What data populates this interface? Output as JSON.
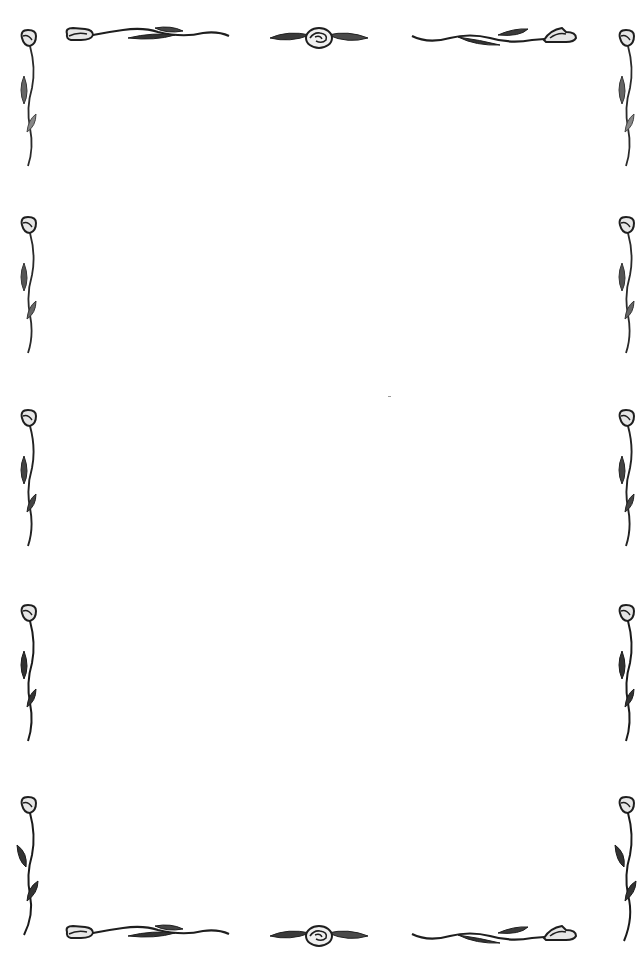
{
  "page": {
    "type": "decorative stationery border",
    "background_color": "#ffffff",
    "ink_color": "#1e1e1e",
    "leaf_shade_color": "#555555",
    "petal_fill_color": "#e6e6e6"
  },
  "border": {
    "motif": "rose bud on stem with leaves",
    "top_row": [
      {
        "name": "top-left-vine",
        "icon": "rose-bud-vine-icon",
        "x": 63,
        "y": 22,
        "w": 168,
        "h": 26,
        "flip": false
      },
      {
        "name": "top-center-rose",
        "icon": "rose-with-leaves-icon",
        "x": 268,
        "y": 26,
        "w": 102,
        "h": 24,
        "flip": false
      },
      {
        "name": "top-right-vine",
        "icon": "rose-bud-vine-icon",
        "x": 410,
        "y": 22,
        "w": 170,
        "h": 26,
        "flip": true
      }
    ],
    "bottom_row": [
      {
        "name": "bottom-left-vine",
        "icon": "rose-bud-vine-icon",
        "x": 63,
        "y": 920,
        "w": 168,
        "h": 26,
        "flip": false
      },
      {
        "name": "bottom-center-rose",
        "icon": "rose-with-leaves-icon",
        "x": 268,
        "y": 924,
        "w": 102,
        "h": 24,
        "flip": false
      },
      {
        "name": "bottom-right-vine",
        "icon": "rose-bud-vine-icon",
        "x": 410,
        "y": 920,
        "w": 170,
        "h": 26,
        "flip": true
      }
    ],
    "left_column_y": [
      28,
      215,
      408,
      603,
      795
    ],
    "right_column_y": [
      28,
      215,
      408,
      603,
      795
    ],
    "side_stem_height": 140
  },
  "content": {
    "body_text": ""
  }
}
